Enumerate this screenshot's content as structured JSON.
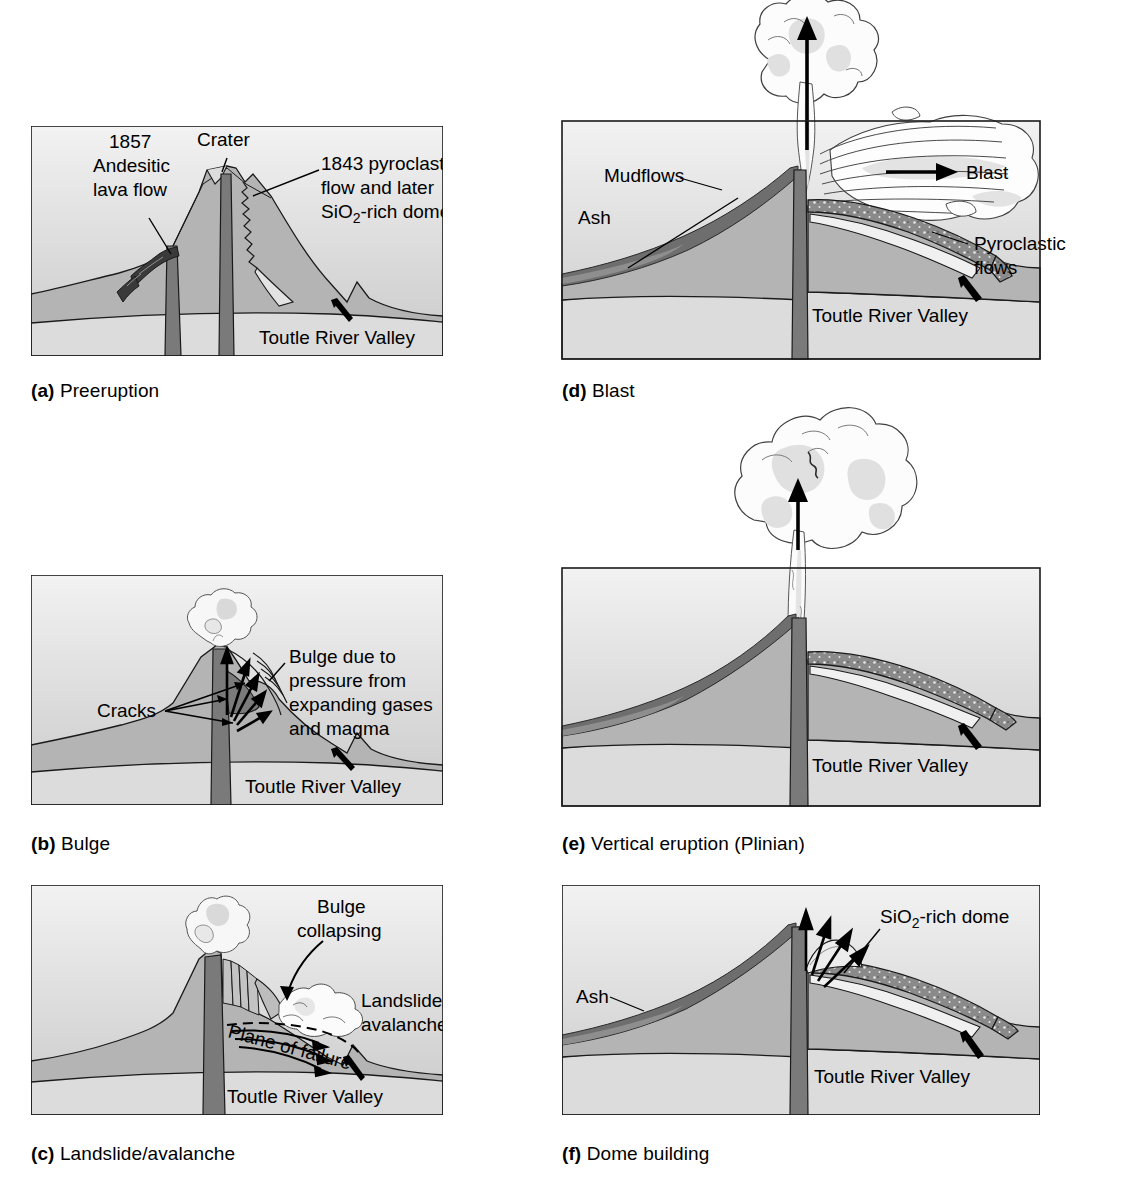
{
  "figure": {
    "colors": {
      "sky_top": "#f2f2f2",
      "sky_bottom": "#c9c9c9",
      "mountain": "#b4b4b4",
      "basement": "#dcdcdc",
      "conduit": "#7a7a7a",
      "ash": "#6e6e6e",
      "lava": "#3a3a3a",
      "pyroclastic": "#8a8a8a",
      "cloud": "#f7f7f7",
      "cloud_shade": "#d9d9d9",
      "outline": "#1a1a1a"
    }
  },
  "panels": [
    {
      "id": "a",
      "caption_letter": "(a)",
      "caption_text": "Preeruption",
      "labels": {
        "lava_flow": "1857\nAndesitic\nlava flow",
        "lava_flow_lines": [
          "1857",
          "Andesitic",
          "lava flow"
        ],
        "crater": "Crater",
        "pyroclastic_lines": [
          "1843 pyroclastic",
          "flow and later",
          "SiO",
          "2",
          "-rich dome"
        ],
        "pyroclastic_l1": "1843 pyroclastic",
        "pyroclastic_l2": "flow and later",
        "pyroclastic_l3_a": "SiO",
        "pyroclastic_l3_sub": "2",
        "pyroclastic_l3_b": "-rich dome",
        "valley": "Toutle River Valley"
      }
    },
    {
      "id": "b",
      "caption_letter": "(b)",
      "caption_text": "Bulge",
      "labels": {
        "cracks": "Cracks",
        "bulge_l1": "Bulge due to",
        "bulge_l2": "pressure from",
        "bulge_l3": "expanding gases",
        "bulge_l4": "and magma",
        "valley": "Toutle River Valley"
      }
    },
    {
      "id": "c",
      "caption_letter": "(c)",
      "caption_text": "Landslide/avalanche",
      "labels": {
        "bulge_l1": "Bulge",
        "bulge_l2": "collapsing",
        "landslide_l1": "Landslide/",
        "landslide_l2": "avalanche",
        "plane_of_failure": "Plane of failure",
        "valley": "Toutle River Valley"
      }
    },
    {
      "id": "d",
      "caption_letter": "(d)",
      "caption_text": "Blast",
      "labels": {
        "mudflows": "Mudflows",
        "ash": "Ash",
        "blast": "Blast",
        "pyroclastic_l1": "Pyroclastic",
        "pyroclastic_l2": "flows",
        "valley": "Toutle River Valley"
      }
    },
    {
      "id": "e",
      "caption_letter": "(e)",
      "caption_text": "Vertical eruption (Plinian)",
      "labels": {
        "valley": "Toutle River Valley"
      }
    },
    {
      "id": "f",
      "caption_letter": "(f)",
      "caption_text": "Dome building",
      "labels": {
        "ash": "Ash",
        "dome_a": "SiO",
        "dome_sub": "2",
        "dome_b": "-rich dome",
        "valley": "Toutle River Valley"
      }
    }
  ]
}
